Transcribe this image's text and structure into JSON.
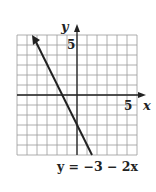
{
  "chart_data": {
    "type": "line",
    "title": "",
    "equation_label": "y = −3 − 2x",
    "xlabel": "x",
    "ylabel": "y",
    "xlim": [
      -6,
      6
    ],
    "ylim": [
      -6,
      6
    ],
    "grid": true,
    "grid_step": 1,
    "tick_labels": {
      "x": [
        "5"
      ],
      "y": [
        "5"
      ]
    },
    "series": [
      {
        "name": "y = -3 - 2x",
        "slope": -2,
        "intercept": -3,
        "x": [
          -4.5,
          1.5
        ],
        "y": [
          6,
          -6
        ],
        "arrow_end": "start"
      }
    ]
  },
  "labels": {
    "x_axis": "x",
    "y_axis": "y",
    "x_tick": "5",
    "y_tick": "5",
    "equation": "y = −3 − 2x"
  },
  "colors": {
    "grid": "#9a9a9a",
    "axis": "#222222",
    "line": "#222222"
  }
}
